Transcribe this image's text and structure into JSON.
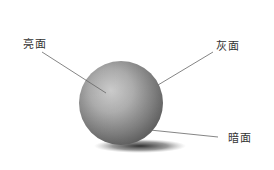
{
  "labels": {
    "highlight": "亮面",
    "halftone": "灰面",
    "shadow": "暗面"
  },
  "colors": {
    "background": "#ffffff",
    "line": "#666666",
    "text": "#333333"
  }
}
